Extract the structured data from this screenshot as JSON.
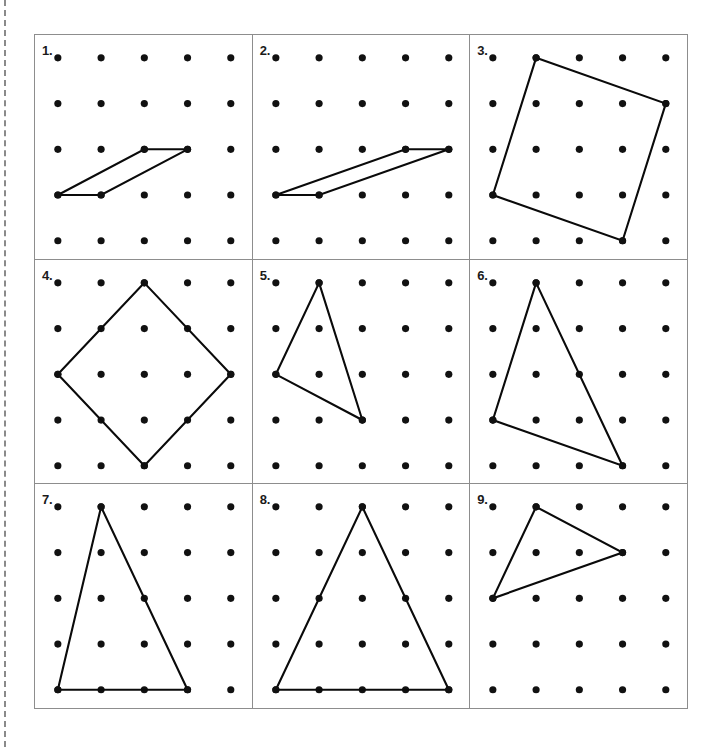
{
  "document": {
    "title": "Geoboard Dot Grid Worksheet",
    "cut_line": "dashed-vertical-left"
  },
  "grid_spec": {
    "dot_rows": 5,
    "dot_cols": 5,
    "dot_radius": 3.6,
    "origin_x": 23,
    "origin_y": 23,
    "step_x": 43.5,
    "step_y": 46.0,
    "panel_border_color": "#8d8d8d",
    "shape_line_color": "#0a0a0a",
    "dot_color": "#111111"
  },
  "panels": [
    {
      "number": "1.",
      "shape": "parallelogram",
      "closed": true,
      "vertices": [
        [
          0,
          3
        ],
        [
          1,
          3
        ],
        [
          3,
          2
        ],
        [
          2,
          2
        ]
      ]
    },
    {
      "number": "2.",
      "shape": "parallelogram",
      "closed": true,
      "vertices": [
        [
          0,
          3
        ],
        [
          1,
          3
        ],
        [
          4,
          2
        ],
        [
          3,
          2
        ]
      ]
    },
    {
      "number": "3.",
      "shape": "tilted-square",
      "closed": true,
      "vertices": [
        [
          1,
          0
        ],
        [
          4,
          1
        ],
        [
          3,
          4
        ],
        [
          0,
          3
        ]
      ]
    },
    {
      "number": "4.",
      "shape": "diamond-square",
      "closed": true,
      "vertices": [
        [
          2,
          0
        ],
        [
          4,
          2
        ],
        [
          2,
          4
        ],
        [
          0,
          2
        ]
      ]
    },
    {
      "number": "5.",
      "shape": "triangle",
      "closed": true,
      "vertices": [
        [
          1,
          0
        ],
        [
          2,
          3
        ],
        [
          0,
          2
        ]
      ]
    },
    {
      "number": "6.",
      "shape": "triangle",
      "closed": true,
      "vertices": [
        [
          1,
          0
        ],
        [
          3,
          4
        ],
        [
          0,
          3
        ]
      ]
    },
    {
      "number": "7.",
      "shape": "triangle",
      "closed": true,
      "vertices": [
        [
          1,
          0
        ],
        [
          3,
          4
        ],
        [
          0,
          4
        ]
      ]
    },
    {
      "number": "8.",
      "shape": "triangle",
      "closed": true,
      "vertices": [
        [
          2,
          0
        ],
        [
          4,
          4
        ],
        [
          0,
          4
        ]
      ]
    },
    {
      "number": "9.",
      "shape": "triangle",
      "closed": true,
      "vertices": [
        [
          1,
          0
        ],
        [
          3,
          1
        ],
        [
          0,
          2
        ]
      ]
    }
  ]
}
